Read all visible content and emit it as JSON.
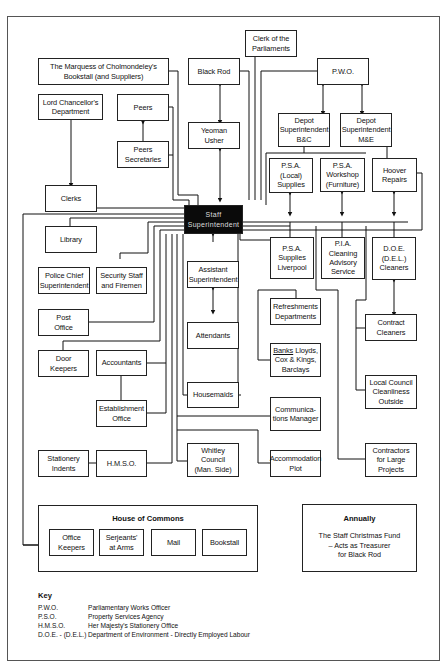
{
  "diagram": {
    "type": "organizational chart",
    "central_node": "Staff Superintendent",
    "nodes": {
      "marquess": "The Marquess of Cholmondeley's\nBookstall (and Suppliers)",
      "black_rod": "Black Rod",
      "clerk_parliaments": "Clerk of the\nParliaments",
      "pwo": "P.W.O.",
      "lord_chancellor": "Lord Chancellor's\nDepartment",
      "peers": "Peers",
      "peers_secretaries": "Peers\nSecretaries",
      "yeoman_usher": "Yeoman\nUsher",
      "depot_bc": "Depot\nSuperintendent\nB&C",
      "depot_me": "Depot\nSuperintendent\nM&E",
      "psa_local": "P.S.A. (Local)\nSupplies",
      "psa_workshop": "P.S.A.\nWorkshop\n(Furniture)",
      "hoover": "Hoover\nRepairs",
      "clerks": "Clerks",
      "staff_superintendent": "Staff\nSuperintendent",
      "library": "Library",
      "police_chief": "Police Chief\nSuperintendent",
      "security_staff": "Security Staff\nand Firemen",
      "assistant_superintendent": "Assistant\nSuperintendent",
      "psa_liverpool": "P.S.A.\nSupplies\nLiverpool",
      "pia_cleaning": "P.I.A.\nCleaning\nAdvisory\nService",
      "doe_cleaners": "D.O.E.\n(D.E.L.)\nCleaners",
      "post_office": "Post\nOffice",
      "attendants": "Attendants",
      "refreshments": "Refreshments\nDepartments",
      "contract_cleaners": "Contract\nCleaners",
      "door_keepers": "Door\nKeepers",
      "accountants": "Accountants",
      "banks_label": "Banks",
      "banks_rest": " Lloyds,\nCox & Kings,\nBarclays",
      "housemaids": "Housemaids",
      "local_council": "Local Council\nCleanliness\nOutside",
      "establishment_office": "Establishment\nOffice",
      "communications_manager": "Communica-\ntions Manager",
      "stationery_indents": "Stationery\nIndents",
      "hmso": "H.M.S.O.",
      "whitley_council": "Whitley\nCouncil\n(Man. Side)",
      "accommodation_plot": "Accommodation\nPlot",
      "contractors": "Contractors\nfor Large\nProjects"
    },
    "house_of_commons": {
      "title": "House of Commons",
      "members": [
        "Office\nKeepers",
        "Serjeants'\nat Arms",
        "Mail",
        "Bookstall"
      ]
    },
    "annually": {
      "title": "Annually",
      "text": "The Staff Christmas Fund\n– Acts as Treasurer\nfor Black Rod"
    },
    "key": {
      "title": "Key",
      "entries": [
        {
          "abbr": "P.W.O.",
          "def": "Parliamentary Works Officer"
        },
        {
          "abbr": "P.S.O.",
          "def": "Property Services Agency"
        },
        {
          "abbr": "H.M.S.O.",
          "def": "Her Majesty's Stationery Office"
        },
        {
          "abbr": "D.O.E. - (D.E.L.)",
          "def": "Department of Environment - Directly Employed Labour"
        }
      ]
    }
  }
}
